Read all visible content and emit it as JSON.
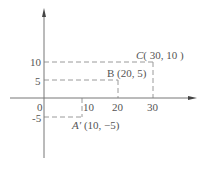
{
  "diagram": {
    "type": "coordinate-plane",
    "colors": {
      "axis": "#777777",
      "dashed": "#999999",
      "text": "#555555"
    },
    "x_ticks": [
      {
        "label": "0",
        "value": 0
      },
      {
        "label": "10",
        "value": 10
      },
      {
        "label": "20",
        "value": 20
      },
      {
        "label": "30",
        "value": 30
      }
    ],
    "y_ticks": [
      {
        "label": "10",
        "value": 10
      },
      {
        "label": "5",
        "value": 5
      },
      {
        "label": "-5",
        "value": -5
      }
    ],
    "points": [
      {
        "name": "C",
        "name_style": "italic",
        "coords": "( 30, 10 )",
        "x": 30,
        "y": 10
      },
      {
        "name": "B",
        "name_style": "normal",
        "coords": "(20, 5)",
        "x": 20,
        "y": 5
      },
      {
        "name": "A′",
        "name_style": "italic",
        "coords": "(10, −5)",
        "x": 10,
        "y": -5
      }
    ]
  }
}
